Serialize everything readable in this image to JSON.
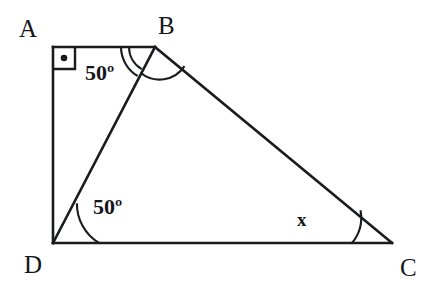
{
  "figure": {
    "type": "geometry-diagram",
    "canvas": {
      "width": 438,
      "height": 298,
      "background": "#ffffff"
    },
    "stroke_color": "#1a1b1f",
    "vertices": [
      {
        "name": "A",
        "label": "A",
        "point": [
          53,
          47
        ],
        "label_pos": [
          19,
          16
        ]
      },
      {
        "name": "B",
        "label": "B",
        "point": [
          155,
          47
        ],
        "label_pos": [
          158,
          13
        ]
      },
      {
        "name": "C",
        "label": "C",
        "point": [
          392,
          243
        ],
        "label_pos": [
          400,
          255
        ]
      },
      {
        "name": "D",
        "label": "D",
        "point": [
          53,
          243
        ],
        "label_pos": [
          24,
          252
        ]
      }
    ],
    "segments": [
      {
        "name": "AB",
        "from": "A",
        "to": "B"
      },
      {
        "name": "AD",
        "from": "A",
        "to": "D"
      },
      {
        "name": "DB",
        "from": "D",
        "to": "B"
      },
      {
        "name": "BC",
        "from": "B",
        "to": "C"
      },
      {
        "name": "DC",
        "from": "D",
        "to": "C"
      }
    ],
    "right_angle": {
      "at": "A",
      "marker": "square-with-dot",
      "size": 22,
      "dot_radius": 3.2
    },
    "angles": [
      {
        "name": "angle-ABD",
        "vertex": "B",
        "label": "50º",
        "label_pos": [
          85,
          62
        ],
        "arcs": 2,
        "arc_radii": [
          34,
          26
        ]
      },
      {
        "name": "angle-DBC",
        "vertex": "B",
        "label": "",
        "arcs": 1,
        "arc_radii": [
          30
        ]
      },
      {
        "name": "angle-BDC",
        "vertex": "D",
        "label": "50º",
        "label_pos": [
          93,
          196
        ],
        "arcs": 1,
        "arc_radii": [
          46
        ]
      },
      {
        "name": "angle-BCD",
        "vertex": "C",
        "label": "x",
        "label_pos": [
          297,
          210
        ],
        "arcs": 1,
        "arc_radii": [
          40
        ]
      }
    ]
  }
}
